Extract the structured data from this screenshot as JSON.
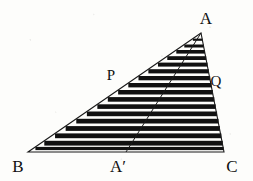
{
  "figure": {
    "kind": "geometry-diagram",
    "canvas": {
      "width": 253,
      "height": 181
    },
    "background_color": "#fdfdfb",
    "ink_color": "#101010",
    "bar_fill_color": "#111111",
    "outline_color": "#1a1a1a",
    "outline_width": 1.1,
    "cevian_width": 1.0,
    "vertices": {
      "A": {
        "x": 201,
        "y": 33,
        "label": "A",
        "label_x": 206,
        "label_y": 24,
        "anchor": "middle"
      },
      "B": {
        "x": 28,
        "y": 152,
        "label": "B",
        "label_x": 18,
        "label_y": 172,
        "anchor": "middle"
      },
      "C": {
        "x": 224,
        "y": 152,
        "label": "C",
        "label_x": 232,
        "label_y": 172,
        "anchor": "middle"
      },
      "Aprime": {
        "x": 126,
        "y": 152,
        "label": "A′",
        "label_x": 118,
        "label_y": 172,
        "anchor": "middle"
      }
    },
    "marked_points": {
      "P": {
        "x": 120,
        "y": 82,
        "label": "P",
        "label_x": 111,
        "label_y": 80,
        "anchor": "middle"
      },
      "Q": {
        "x": 209,
        "y": 85,
        "label": "Q",
        "label_x": 216,
        "label_y": 86,
        "anchor": "middle"
      }
    },
    "bars": {
      "count": 17,
      "note": "Horizontal black rectangles stacked from apex to base; left edge steps along AB, right edge follows AC.",
      "rows": [
        {
          "top": 44.5,
          "height": 3.0
        },
        {
          "top": 50.0,
          "height": 3.6
        },
        {
          "top": 56.2,
          "height": 3.8
        },
        {
          "top": 62.6,
          "height": 4.0
        },
        {
          "top": 69.2,
          "height": 4.2
        },
        {
          "top": 76.0,
          "height": 4.3
        },
        {
          "top": 83.0,
          "height": 4.4
        },
        {
          "top": 90.0,
          "height": 4.5
        },
        {
          "top": 97.1,
          "height": 4.6
        },
        {
          "top": 104.3,
          "height": 4.6
        },
        {
          "top": 111.5,
          "height": 4.7
        },
        {
          "top": 118.8,
          "height": 4.7
        },
        {
          "top": 126.1,
          "height": 4.8
        },
        {
          "top": 133.4,
          "height": 4.8
        },
        {
          "top": 140.8,
          "height": 4.8
        },
        {
          "top": 146.9,
          "height": 3.2
        },
        {
          "top": 38.6,
          "height": 2.2
        }
      ]
    }
  }
}
